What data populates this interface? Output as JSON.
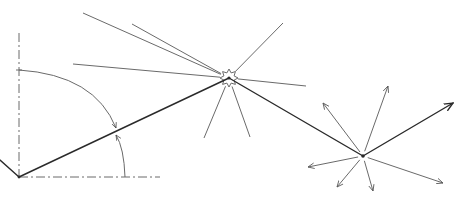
{
  "diagram": {
    "colors": {
      "stroke_main": "#2a2a2a",
      "stroke_light": "#6a6a6a",
      "background": "#ffffff"
    },
    "nodes": {
      "origin": {
        "x": 19,
        "y": 177
      },
      "scatterer": {
        "x": 229,
        "y": 78
      },
      "emitter": {
        "x": 363,
        "y": 156
      }
    },
    "axes": {
      "vertical_dashed": {
        "x1": 19,
        "y1": 33,
        "x2": 19,
        "y2": 177
      },
      "horizontal_dashed": {
        "x1": 19,
        "y1": 177,
        "x2": 160,
        "y2": 177
      }
    },
    "main_path": [
      {
        "x1": 0,
        "y1": 160,
        "x2": 19,
        "y2": 177
      },
      {
        "x1": 19,
        "y1": 177,
        "x2": 229,
        "y2": 78
      },
      {
        "x1": 229,
        "y1": 78,
        "x2": 363,
        "y2": 156
      },
      {
        "x1": 363,
        "y1": 156,
        "x2": 453,
        "y2": 103
      }
    ],
    "angle_arcs": [
      {
        "name": "angle-from-vertical",
        "d": "M 19 70 Q 95 75 116 128"
      },
      {
        "name": "angle-from-horizontal",
        "d": "M 125 177 Q 124 148 116 135"
      }
    ],
    "star_rays": [
      {
        "x": 73,
        "y": 64
      },
      {
        "x": 83,
        "y": 13
      },
      {
        "x": 132,
        "y": 24
      },
      {
        "x": 283,
        "y": 23
      },
      {
        "x": 306,
        "y": 86
      },
      {
        "x": 204,
        "y": 138
      },
      {
        "x": 250,
        "y": 137
      }
    ],
    "emitter_arrows": [
      {
        "x": 323,
        "y": 103
      },
      {
        "x": 388,
        "y": 86
      },
      {
        "x": 308,
        "y": 167
      },
      {
        "x": 337,
        "y": 187
      },
      {
        "x": 373,
        "y": 191
      },
      {
        "x": 443,
        "y": 183
      }
    ]
  }
}
